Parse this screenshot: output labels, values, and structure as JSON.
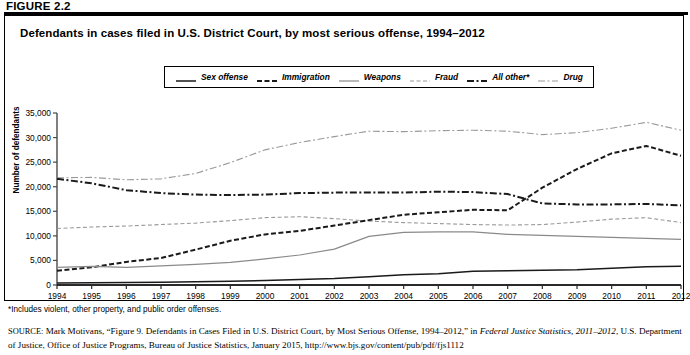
{
  "figure": {
    "label": "FIGURE 2.2",
    "title": "Defendants in cases filed in U.S. District Court, by most serious offense, 1994–2012"
  },
  "footnote": "*Includes violent, other property, and public order offenses.",
  "source": {
    "prefix": "SOURCE:",
    "part1": " Mark Motivans, “Figure 9. Defendants in Cases Filed in U.S. District Court, by Most Serious Offense, 1994–2012,” in ",
    "italic1": "Federal Justice Statistics, 2011–2012",
    "part2": ", U.S. Department of Justice, Office of Justice Programs, Bureau of Justice Statistics, January 2015, http://www.bjs.gov/content/pub/pdf/fjs1112"
  },
  "legend": {
    "items": [
      {
        "label": "Sex offense",
        "style": "solid-dark",
        "color": "#1a1a1a"
      },
      {
        "label": "Immigration",
        "style": "dashed-dark",
        "color": "#1a1a1a"
      },
      {
        "label": "Weapons",
        "style": "solid-gray",
        "color": "#8a8a8a"
      },
      {
        "label": "Fraud",
        "style": "dashed-gray",
        "color": "#9a9a9a"
      },
      {
        "label": "All other*",
        "style": "dashdot-dark",
        "color": "#1a1a1a"
      },
      {
        "label": "Drug",
        "style": "dashdot-gray",
        "color": "#9a9a9a"
      }
    ]
  },
  "chart_data": {
    "type": "line",
    "title": "Defendants in cases filed in U.S. District Court, by most serious offense, 1994–2012",
    "xlabel": "",
    "ylabel": "Number of defendants",
    "xlim": [
      1994,
      2012
    ],
    "ylim": [
      0,
      35000
    ],
    "ytick_step": 5000,
    "grid": false,
    "legend_position": "top-center",
    "x": [
      1994,
      1995,
      1996,
      1997,
      1998,
      1999,
      2000,
      2001,
      2002,
      2003,
      2004,
      2005,
      2006,
      2007,
      2008,
      2009,
      2010,
      2011,
      2012
    ],
    "ytick_labels": [
      "0",
      "5,000",
      "10,000",
      "15,000",
      "20,000",
      "25,000",
      "30,000",
      "35,000"
    ],
    "xtick_labels": [
      "1994",
      "1995",
      "1996",
      "1997",
      "1998",
      "1999",
      "2000",
      "2001",
      "2002",
      "2003",
      "2004",
      "2005",
      "2006",
      "2007",
      "2008",
      "2009",
      "2010",
      "2011",
      "2012"
    ],
    "series": [
      {
        "name": "Drug",
        "style": "dashdot-gray",
        "color": "#9a9a9a",
        "values": [
          21800,
          21900,
          21400,
          21600,
          22700,
          24900,
          27500,
          29000,
          30200,
          31300,
          31200,
          31400,
          31500,
          31300,
          30600,
          31000,
          31900,
          33100,
          31500
        ]
      },
      {
        "name": "All other*",
        "style": "dashdot-dark",
        "color": "#1a1a1a",
        "values": [
          21600,
          20700,
          19300,
          18700,
          18400,
          18300,
          18400,
          18700,
          18800,
          18800,
          18800,
          19000,
          18900,
          18500,
          16600,
          16400,
          16400,
          16500,
          16200
        ]
      },
      {
        "name": "Fraud",
        "style": "dashed-gray",
        "color": "#9a9a9a",
        "values": [
          11500,
          11800,
          12000,
          12300,
          12600,
          13100,
          13700,
          13900,
          13500,
          13000,
          12700,
          12500,
          12300,
          12200,
          12300,
          12800,
          13400,
          13700,
          12700
        ]
      },
      {
        "name": "Immigration",
        "style": "dashed-dark",
        "color": "#1a1a1a",
        "values": [
          2900,
          3600,
          4700,
          5500,
          7200,
          9000,
          10300,
          11000,
          12100,
          13200,
          14300,
          14800,
          15300,
          15200,
          19800,
          23600,
          26800,
          28300,
          26300
        ]
      },
      {
        "name": "Weapons",
        "style": "solid-gray",
        "color": "#8a8a8a",
        "values": [
          3600,
          3800,
          3600,
          3900,
          4200,
          4600,
          5300,
          6100,
          7300,
          9900,
          10700,
          10800,
          10800,
          10300,
          10100,
          9900,
          9700,
          9500,
          9300
        ]
      },
      {
        "name": "Sex offense",
        "style": "solid-dark",
        "color": "#1a1a1a",
        "values": [
          400,
          450,
          500,
          550,
          650,
          750,
          900,
          1100,
          1300,
          1700,
          2100,
          2300,
          2800,
          2900,
          3000,
          3100,
          3400,
          3700,
          3800
        ]
      }
    ]
  }
}
